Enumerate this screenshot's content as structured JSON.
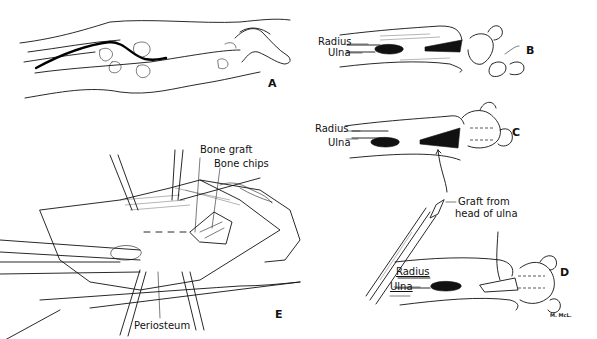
{
  "figure": {
    "panels": [
      {
        "id": "A",
        "letter": "A",
        "description": "Forearm and hand outline with dorsal incision line"
      },
      {
        "id": "B",
        "letter": "B",
        "labels": {
          "radius": "Radius",
          "ulna": "Ulna"
        }
      },
      {
        "id": "C",
        "letter": "C",
        "labels": {
          "radius": "Radius",
          "ulna": "Ulna",
          "graft": "Graft from",
          "graft2": "head of ulna"
        }
      },
      {
        "id": "D",
        "letter": "D",
        "labels": {
          "radius": "Radius",
          "ulna": "Ulna"
        },
        "signature": "M. McL."
      },
      {
        "id": "E",
        "letter": "E",
        "labels": {
          "bone_graft": "Bone graft",
          "bone_chips": "Bone chips",
          "periosteum": "Periosteum"
        }
      }
    ]
  },
  "colors": {
    "ink": "#111111",
    "background": "#ffffff"
  }
}
